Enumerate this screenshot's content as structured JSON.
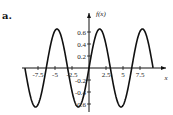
{
  "figure_label": "a.",
  "chart_data": {
    "type": "line",
    "title": "",
    "xlabel": "x",
    "ylabel": "f(x)",
    "function": "0.65*sin(x)",
    "x_range": [
      -9.42,
      9.42
    ],
    "xlim": [
      -9.5,
      10.5
    ],
    "ylim": [
      -0.7,
      0.75
    ],
    "x_ticks": [
      -7.5,
      -5,
      -2.5,
      2.5,
      5,
      7.5
    ],
    "x_tick_labels": [
      "-7.5",
      "-5",
      "-2.5",
      "2.5",
      "5",
      "7.5"
    ],
    "y_ticks": [
      0.6,
      0.4,
      0.2,
      -0.2,
      -0.4,
      -0.6
    ],
    "y_tick_labels": [
      "0.6",
      "0.4",
      "0.2",
      "-0.2",
      "-0.4",
      "-0.6"
    ],
    "grid": false,
    "legend": null,
    "series": [
      {
        "name": "f(x)",
        "amplitude": 0.65,
        "zeros": [
          -9.42,
          -6.28,
          -3.14,
          0,
          3.14,
          6.28,
          9.42
        ],
        "maxima": [
          [
            -4.71,
            0.65
          ],
          [
            1.57,
            0.65
          ],
          [
            7.85,
            0.65
          ]
        ],
        "minima": [
          [
            -7.85,
            -0.65
          ],
          [
            -1.57,
            -0.65
          ],
          [
            4.71,
            -0.65
          ]
        ]
      }
    ],
    "line_color": "#111111"
  }
}
